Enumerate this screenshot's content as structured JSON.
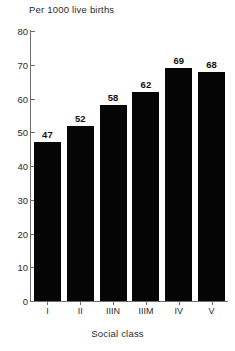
{
  "chart_data": {
    "type": "bar",
    "title": "Per 1000 live births",
    "xlabel": "Social class",
    "ylabel": "",
    "categories": [
      "I",
      "II",
      "IIIN",
      "IIIM",
      "IV",
      "V"
    ],
    "values": [
      47,
      52,
      58,
      62,
      69,
      68
    ],
    "value_labels": [
      "47",
      "52",
      "58",
      "62",
      "69",
      "68"
    ],
    "ylim": [
      0,
      80
    ],
    "yticks": [
      0,
      10,
      20,
      30,
      40,
      50,
      60,
      70,
      80
    ],
    "ytick_labels": [
      "0",
      "10",
      "20",
      "30",
      "40",
      "50",
      "60",
      "70",
      "80"
    ],
    "grid": false,
    "legend": null,
    "bar_color": "#050505",
    "axis_color": "#6f6f6f",
    "text_color": "#2b2b2b",
    "background": "#ffffff"
  }
}
